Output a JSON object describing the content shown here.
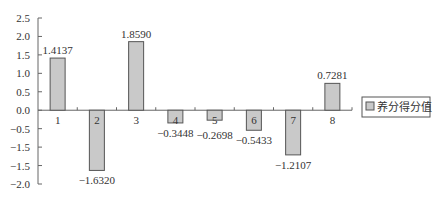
{
  "chart_data": {
    "type": "bar",
    "title": "",
    "xlabel": "",
    "ylabel": "",
    "categories": [
      "1",
      "2",
      "3",
      "4",
      "5",
      "6",
      "7",
      "8"
    ],
    "series": [
      {
        "name": "养分得分值",
        "values": [
          1.4137,
          -1.632,
          1.859,
          -0.3448,
          -0.2698,
          -0.5433,
          -1.2107,
          0.7281
        ],
        "labels": [
          "1.4137",
          "−1.6320",
          "1.8590",
          "−0.3448",
          "−0.2698",
          "−0.5433",
          "−1.2107",
          "0.7281"
        ]
      }
    ],
    "ylim": [
      -2.0,
      2.5
    ],
    "yticks": [
      2.5,
      2.0,
      1.5,
      1.0,
      0.5,
      0.0,
      -0.5,
      -1.0,
      -1.5,
      -2.0
    ],
    "ytick_labels": [
      "2.5",
      "2.0",
      "1.5",
      "1.0",
      "0.5",
      "0.0",
      "−0.5",
      "−1.5",
      "−1.5",
      "−2.0"
    ],
    "grid": false,
    "legend": {
      "position": "right",
      "entries": [
        "养分得分值"
      ]
    },
    "colors": {
      "bar_fill": "#c9c9c9",
      "bar_stroke": "#555555",
      "axis": "#666666"
    }
  }
}
